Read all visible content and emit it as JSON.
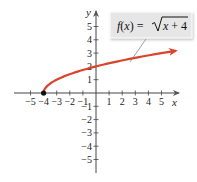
{
  "chart_data": {
    "type": "line",
    "title": "",
    "function_label": "f(x) = √(x + 4)",
    "label_parts": {
      "lhs": "f(x) = ",
      "radicand": "x + 4"
    },
    "xlabel": "x",
    "ylabel": "y",
    "xlim": [
      -5,
      5
    ],
    "ylim": [
      -5,
      5
    ],
    "x_ticks": [
      -5,
      -4,
      -3,
      -2,
      -1,
      1,
      2,
      3,
      4,
      5
    ],
    "y_ticks": [
      -5,
      -4,
      -3,
      -2,
      -1,
      1,
      2,
      3,
      4,
      5
    ],
    "x_tick_labels": [
      "−5",
      "−4",
      "−3",
      "−2",
      "−1",
      "1",
      "2",
      "3",
      "4",
      "5"
    ],
    "y_tick_labels": [
      "−5",
      "−4",
      "−3",
      "−2",
      "−1",
      "1",
      "2",
      "3",
      "4",
      "5"
    ],
    "grid": false,
    "legend": "callout box top-right",
    "series": [
      {
        "name": "f(x) = √(x + 4)",
        "color": "#d9442b",
        "start_point": [
          -4,
          0
        ],
        "x": [
          -4,
          -3,
          -2,
          -1,
          0,
          1,
          2,
          3,
          4,
          5,
          6
        ],
        "y": [
          0,
          1,
          1.414,
          1.732,
          2,
          2.236,
          2.449,
          2.646,
          2.828,
          3,
          3.162
        ]
      }
    ]
  },
  "colors": {
    "curve": "#d9442b",
    "axes": "#333333",
    "callout_bg": "#e6e6e6",
    "callout_border": "#ffffff"
  }
}
